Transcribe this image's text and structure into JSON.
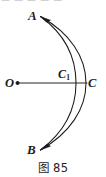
{
  "figure": {
    "caption": "图 85",
    "top_bleed_text": "— — — —  —  ’",
    "background_color": "#ffffff",
    "ink_color": "#1b1b1b",
    "points": [
      {
        "id": "A",
        "label": "A",
        "sub": "",
        "x": 40,
        "y": 16,
        "label_x": 28,
        "label_y": 8.5
      },
      {
        "id": "B",
        "label": "B",
        "sub": "",
        "x": 40,
        "y": 150,
        "label_x": 27,
        "label_y": 143
      },
      {
        "id": "O",
        "label": "O",
        "sub": "",
        "x": 16,
        "y": 83,
        "label_x": 5,
        "label_y": 76.5
      },
      {
        "id": "C",
        "label": "C",
        "sub": "",
        "x": 86,
        "y": 83,
        "label_x": 88,
        "label_y": 76.5
      },
      {
        "id": "C1",
        "label": "C",
        "sub": "1",
        "x": 76,
        "y": 83,
        "label_x": 58,
        "label_y": 67.5
      }
    ],
    "segments": [
      {
        "id": "OC",
        "from": "O",
        "to": "C",
        "x1": 16,
        "y1": 83,
        "x2": 87,
        "y2": 83
      }
    ],
    "arcs": [
      {
        "id": "arc-outer-ACB",
        "from": "A",
        "through": "C",
        "to": "B",
        "bulge_x": 86
      },
      {
        "id": "arc-inner-AC1B",
        "from": "A",
        "through": "C1",
        "to": "B",
        "bulge_x": 76
      }
    ],
    "markers": [
      {
        "id": "center-dot-O",
        "x": 17.5,
        "y": 83,
        "r": 1.9
      }
    ],
    "arrowheads": [
      {
        "id": "arrow-to-A",
        "target": "A",
        "tip_x": 40.5,
        "tip_y": 16.5
      },
      {
        "id": "arrow-to-B",
        "target": "B",
        "tip_x": 40.5,
        "tip_y": 150.0
      }
    ]
  }
}
